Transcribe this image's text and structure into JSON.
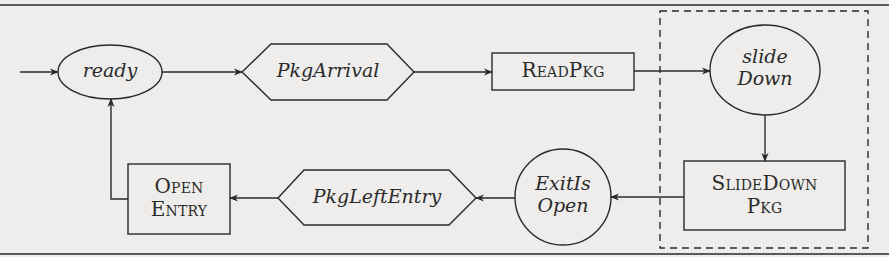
{
  "diagram": {
    "type": "state-machine",
    "colors": {
      "stroke": "#2a2a2a",
      "background": "#eeedeb"
    },
    "states": [
      {
        "id": "ready",
        "label": "ready",
        "shape": "ellipse",
        "style": "italic"
      },
      {
        "id": "slideDown",
        "line1": "slide",
        "line2": "Down",
        "shape": "ellipse",
        "style": "italic"
      },
      {
        "id": "exitIsOpen",
        "line1": "ExitIs",
        "line2": "Open",
        "shape": "ellipse",
        "style": "italic"
      }
    ],
    "events": [
      {
        "id": "pkgArrival",
        "label": "PkgArrival",
        "shape": "hexagon",
        "style": "italic"
      },
      {
        "id": "pkgLeftEntry",
        "label": "PkgLeftEntry",
        "shape": "hexagon",
        "style": "italic"
      }
    ],
    "actions": [
      {
        "id": "readPkg",
        "label": "ReadPkg",
        "shape": "rectangle",
        "style": "small-caps"
      },
      {
        "id": "slideDownPkg",
        "line1": "SlideDown",
        "line2": "Pkg",
        "shape": "rectangle",
        "style": "small-caps"
      },
      {
        "id": "openEntry",
        "line1": "Open",
        "line2": "Entry",
        "shape": "rectangle",
        "style": "small-caps"
      }
    ],
    "edges": [
      {
        "from": "start",
        "to": "ready"
      },
      {
        "from": "ready",
        "to": "pkgArrival"
      },
      {
        "from": "pkgArrival",
        "to": "readPkg"
      },
      {
        "from": "readPkg",
        "to": "slideDown"
      },
      {
        "from": "slideDown",
        "to": "slideDownPkg"
      },
      {
        "from": "slideDownPkg",
        "to": "exitIsOpen"
      },
      {
        "from": "exitIsOpen",
        "to": "pkgLeftEntry"
      },
      {
        "from": "pkgLeftEntry",
        "to": "openEntry"
      },
      {
        "from": "openEntry",
        "to": "ready"
      }
    ],
    "group": {
      "id": "slide-down-region",
      "border": "dashed",
      "contains": [
        "slideDown",
        "slideDownPkg"
      ]
    }
  }
}
